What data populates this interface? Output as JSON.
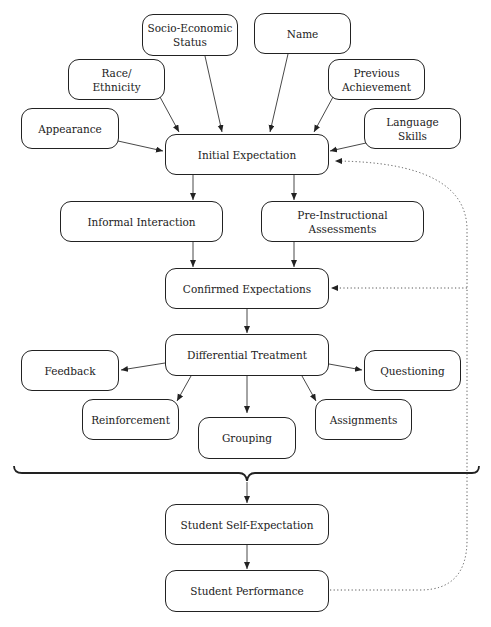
{
  "diagram": {
    "type": "flowchart",
    "nodes": {
      "socio_economic": "Socio-Economic\nStatus",
      "name": "Name",
      "race": "Race/\nEthnicity",
      "previous": "Previous\nAchievement",
      "appearance": "Appearance",
      "language": "Language\nSkills",
      "initial": "Initial Expectation",
      "informal": "Informal Interaction",
      "preinstructional": "Pre-Instructional Assessments",
      "confirmed": "Confirmed Expectations",
      "differential": "Differential Treatment",
      "feedback": "Feedback",
      "questioning": "Questioning",
      "reinforcement": "Reinforcement",
      "grouping": "Grouping",
      "assignments": "Assignments",
      "self_expectation": "Student Self-Expectation",
      "performance": "Student Performance"
    },
    "edges": [
      [
        "appearance",
        "initial",
        "solid"
      ],
      [
        "race",
        "initial",
        "solid"
      ],
      [
        "socio_economic",
        "initial",
        "solid"
      ],
      [
        "name",
        "initial",
        "solid"
      ],
      [
        "previous",
        "initial",
        "solid"
      ],
      [
        "language",
        "initial",
        "solid"
      ],
      [
        "initial",
        "informal",
        "solid"
      ],
      [
        "initial",
        "preinstructional",
        "solid"
      ],
      [
        "informal",
        "confirmed",
        "solid"
      ],
      [
        "preinstructional",
        "confirmed",
        "solid"
      ],
      [
        "confirmed",
        "differential",
        "solid"
      ],
      [
        "differential",
        "feedback",
        "solid"
      ],
      [
        "differential",
        "questioning",
        "solid"
      ],
      [
        "differential",
        "reinforcement",
        "solid"
      ],
      [
        "differential",
        "grouping",
        "solid"
      ],
      [
        "differential",
        "assignments",
        "solid"
      ],
      [
        "brace",
        "self_expectation",
        "solid"
      ],
      [
        "self_expectation",
        "performance",
        "solid"
      ],
      [
        "performance",
        "initial",
        "dotted"
      ],
      [
        "performance",
        "confirmed",
        "dotted"
      ]
    ]
  }
}
